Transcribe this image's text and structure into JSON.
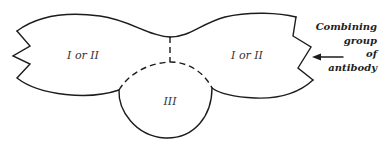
{
  "diagram": {
    "type": "antigen-antibody schematic",
    "regions": {
      "left": {
        "label": "I or II"
      },
      "right": {
        "label": "I or II"
      },
      "bottom": {
        "label": "III"
      }
    },
    "annotation": {
      "lines": [
        "Combining",
        "group",
        "of",
        "antibody"
      ],
      "points_to": "right zigzag edge (combining site)"
    },
    "colors": {
      "stroke": "#1c1c1c",
      "background": "#ffffff",
      "text": "#333333"
    }
  }
}
